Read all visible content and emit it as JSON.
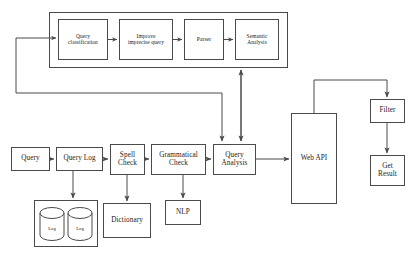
{
  "diagram": {
    "stroke_color": "#4a4a4a",
    "text_color": "#1a1a1a",
    "background": "#ffffff",
    "groups": [
      {
        "name": "query-understanding-group",
        "x": 49,
        "y": 12,
        "w": 239,
        "h": 56
      },
      {
        "name": "log-store-group",
        "x": 34,
        "y": 200,
        "w": 64,
        "h": 47
      }
    ],
    "nodes": [
      {
        "id": "query-classification",
        "label": "Query\nclassification",
        "x": 58,
        "y": 19,
        "w": 50,
        "h": 41,
        "font": 5.4
      },
      {
        "id": "improve-imprecise-query",
        "label": "Improve\nimprecise query",
        "x": 119,
        "y": 19,
        "w": 54,
        "h": 41,
        "font": 5.4
      },
      {
        "id": "parser",
        "label": "Parser",
        "x": 184,
        "y": 19,
        "w": 40,
        "h": 41,
        "font": 5.6
      },
      {
        "id": "semantic-analysis",
        "label": "Semantic\nAnalysis",
        "x": 235,
        "y": 19,
        "w": 44,
        "h": 41,
        "font": 5.4
      },
      {
        "id": "query",
        "label": "Query",
        "x": 11,
        "y": 147,
        "w": 39,
        "h": 24,
        "font": 7.2
      },
      {
        "id": "query-log",
        "label": "Query Log",
        "x": 56,
        "y": 147,
        "w": 47,
        "h": 24,
        "font": 7.2
      },
      {
        "id": "spell-check",
        "label": "Spell\nCheck",
        "x": 110,
        "y": 144,
        "w": 35,
        "h": 31,
        "font": 7.2
      },
      {
        "id": "grammatical-check",
        "label": "Grammatical\nCheck",
        "x": 151,
        "y": 144,
        "w": 55,
        "h": 31,
        "font": 7.2
      },
      {
        "id": "query-analysis",
        "label": "Query\nAnalysis",
        "x": 213,
        "y": 144,
        "w": 43,
        "h": 31,
        "font": 7.2
      },
      {
        "id": "web-api",
        "label": "Web API",
        "x": 291,
        "y": 113,
        "w": 46,
        "h": 91,
        "font": 7.2
      },
      {
        "id": "filter",
        "label": "Filter",
        "x": 370,
        "y": 99,
        "w": 35,
        "h": 24,
        "font": 7.2
      },
      {
        "id": "get-result",
        "label": "Get\nResult",
        "x": 370,
        "y": 155,
        "w": 35,
        "h": 31,
        "font": 7.2
      },
      {
        "id": "dictionary",
        "label": "Dictionary",
        "x": 103,
        "y": 203,
        "w": 48,
        "h": 35,
        "font": 7.2
      },
      {
        "id": "nlp",
        "label": "NLP",
        "x": 165,
        "y": 200,
        "w": 36,
        "h": 25,
        "font": 7.2
      }
    ],
    "cylinders": [
      {
        "id": "log-store-1",
        "label": "Log",
        "x": 39,
        "y": 207,
        "w": 26,
        "h": 34,
        "font": 4.6
      },
      {
        "id": "log-store-2",
        "label": "Log",
        "x": 67,
        "y": 207,
        "w": 26,
        "h": 34,
        "font": 4.6
      }
    ],
    "edges": [
      {
        "id": "feedback-to-query-classification",
        "from": "query-analysis-left-bus",
        "to": "query-classification"
      },
      {
        "id": "query-to-query-log",
        "from": "query",
        "to": "query-log"
      },
      {
        "id": "query-log-to-spell-check",
        "from": "query-log",
        "to": "spell-check"
      },
      {
        "id": "spell-check-to-grammatical-check",
        "from": "spell-check",
        "to": "grammatical-check"
      },
      {
        "id": "grammatical-check-to-query-analysis",
        "from": "grammatical-check",
        "to": "query-analysis"
      },
      {
        "id": "query-analysis-to-web-api",
        "from": "query-analysis",
        "to": "web-api"
      },
      {
        "id": "web-api-to-filter",
        "from": "web-api",
        "to": "filter"
      },
      {
        "id": "filter-to-get-result",
        "from": "filter",
        "to": "get-result"
      },
      {
        "id": "query-log-to-log-store",
        "from": "query-log",
        "to": "log-store-group"
      },
      {
        "id": "spell-check-to-dictionary",
        "from": "spell-check",
        "to": "dictionary"
      },
      {
        "id": "grammatical-check-to-nlp",
        "from": "grammatical-check",
        "to": "nlp"
      },
      {
        "id": "query-classification-chain-1",
        "from": "query-classification",
        "to": "improve-imprecise-query"
      },
      {
        "id": "query-classification-chain-2",
        "from": "improve-imprecise-query",
        "to": "parser"
      },
      {
        "id": "query-classification-chain-3",
        "from": "parser",
        "to": "semantic-analysis"
      },
      {
        "id": "query-analysis-to-understanding-group",
        "from": "query-analysis",
        "to": "query-understanding-group",
        "bidirectional": true
      },
      {
        "id": "understanding-group-to-query-analysis-bus",
        "from": "query-understanding-group",
        "to": "query-analysis"
      }
    ]
  }
}
